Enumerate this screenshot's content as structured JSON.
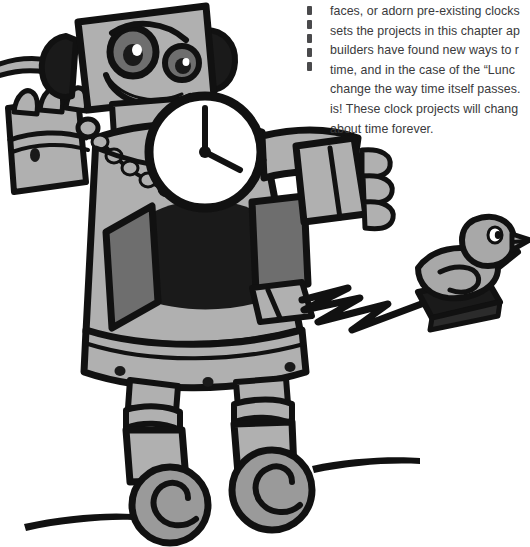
{
  "page": {
    "background_color": "#ffffff",
    "width": 530,
    "height": 547
  },
  "body_text": {
    "color": "#3a3a3c",
    "lines": [
      "faces, or adorn pre-existing clocks",
      "sets the projects in this chapter ap",
      "builders have found new ways to r",
      "time, and in the case of the “Lunc",
      "change the way time itself passes.",
      "is!  These clock projects will chang",
      "about time forever."
    ]
  },
  "dash_rule": {
    "name": "dashed-vertical-rule",
    "dash_count": 5,
    "color": "#4a4a4c"
  },
  "illustration": {
    "title": "robot-with-clock-and-pull-toy-duck",
    "palette": {
      "outline": "#111111",
      "body_fill": "#b0b0b0",
      "panel_fill": "#6e6e6e",
      "dark_fill": "#1a1a1a",
      "clock_face": "#ffffff",
      "wheel_fill": "#9a9a9a",
      "duck_fill": "#a8a8a8"
    },
    "clock": {
      "name": "chest-clock",
      "face_color": "#ffffff",
      "hands": {
        "minute": "12",
        "hour": "4"
      }
    },
    "robot": {
      "head": "box-head-with-two-eyes-and-smile",
      "ears": 2,
      "hands": 2,
      "legs": 2,
      "wheels": 2,
      "necklace": "beaded-chain"
    },
    "duck": {
      "name": "pull-toy-duck",
      "platform": "dark-base-with-pull-string"
    }
  }
}
